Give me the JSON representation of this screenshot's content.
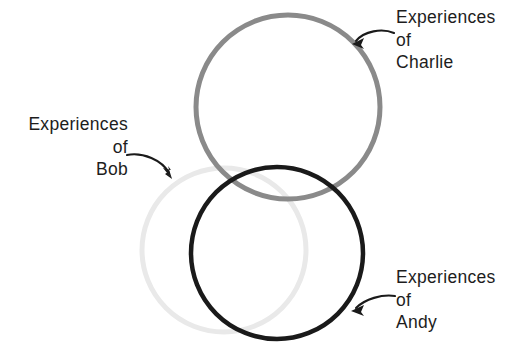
{
  "diagram": {
    "background_color": "#ffffff",
    "circles": [
      {
        "id": "charlie",
        "person": "Charlie",
        "color": "#8a8a8a",
        "cx": 288,
        "cy": 107,
        "r": 92,
        "stroke_width": 5
      },
      {
        "id": "bob",
        "person": "Bob",
        "color": "#e9e9e9",
        "cx": 224,
        "cy": 250,
        "r": 82,
        "stroke_width": 5
      },
      {
        "id": "andy",
        "person": "Andy",
        "color": "#1a1a1a",
        "cx": 277,
        "cy": 253,
        "r": 86,
        "stroke_width": 4.5
      }
    ],
    "labels": {
      "charlie": {
        "line1": "Experiences",
        "line2": "of",
        "line3": "Charlie"
      },
      "bob": {
        "line1": "Experiences",
        "line2": "of",
        "line3": "Bob"
      },
      "andy": {
        "line1": "Experiences",
        "line2": "of",
        "line3": "Andy"
      }
    },
    "arrows": [
      {
        "id": "charlie-arrow",
        "from": [
          394,
          34
        ],
        "to": [
          353,
          44
        ],
        "color": "#1a1a1a"
      },
      {
        "id": "bob-arrow",
        "from": [
          128,
          156
        ],
        "to": [
          171,
          177
        ],
        "color": "#1a1a1a"
      },
      {
        "id": "andy-arrow",
        "from": [
          394,
          296
        ],
        "to": [
          352,
          310
        ],
        "color": "#1a1a1a"
      }
    ]
  }
}
